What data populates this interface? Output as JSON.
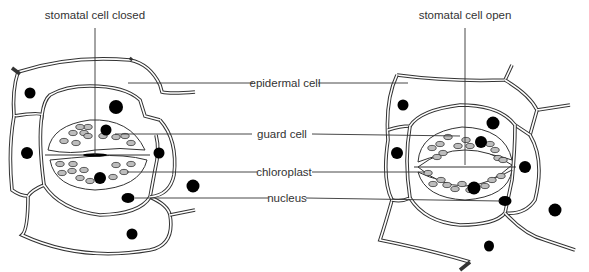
{
  "diagram": {
    "title_left": "stomatal cell closed",
    "title_right": "stomatal cell open",
    "labels": {
      "epidermal_cell": "epidermal cell",
      "guard_cell": "guard cell",
      "chloroplast": "chloroplast",
      "nucleus": "nucleus"
    },
    "colors": {
      "outline": "#333333",
      "nucleus": "#000000",
      "chloroplast": "#bdbdbd",
      "background": "#ffffff"
    },
    "panels": [
      {
        "name": "closed",
        "caption": "stomatal cell closed"
      },
      {
        "name": "open",
        "caption": "stomatal cell open"
      }
    ]
  }
}
